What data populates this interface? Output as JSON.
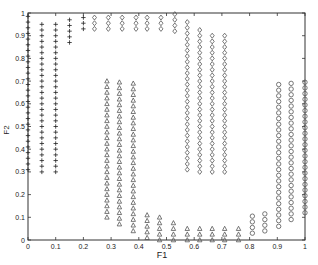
{
  "chart_data": {
    "type": "scatter",
    "title": "",
    "xlabel": "F1",
    "ylabel": "F2",
    "xlim": [
      0,
      1
    ],
    "ylim": [
      0,
      1
    ],
    "grid": false,
    "legend": null,
    "x_ticks": [
      "0",
      "0.1",
      "0.2",
      "0.3",
      "0.4",
      "0.5",
      "0.6",
      "0.7",
      "0.8",
      "0.9",
      "1"
    ],
    "y_ticks": [
      "0",
      "0.1",
      "0.2",
      "0.3",
      "0.4",
      "0.5",
      "0.6",
      "0.7",
      "0.8",
      "0.9",
      "1"
    ],
    "point_step": 0.025,
    "series": [
      {
        "name": "plus",
        "marker": "+",
        "columns": [
          {
            "x": 0.0,
            "y_from": 0.31,
            "y_to": 1.0
          },
          {
            "x": 0.05,
            "y_from": 0.3,
            "y_to": 0.95
          },
          {
            "x": 0.1,
            "y_from": 0.3,
            "y_to": 0.97
          },
          {
            "x": 0.15,
            "y_from": 0.87,
            "y_to": 0.99
          },
          {
            "x": 0.2,
            "y_from": 0.93,
            "y_to": 0.99
          }
        ]
      },
      {
        "name": "diamond",
        "marker": "diamond",
        "columns": [
          {
            "x": 0.24,
            "y_from": 0.93,
            "y_to": 1.0
          },
          {
            "x": 0.29,
            "y_from": 0.93,
            "y_to": 1.0
          },
          {
            "x": 0.34,
            "y_from": 0.93,
            "y_to": 1.0
          },
          {
            "x": 0.39,
            "y_from": 0.93,
            "y_to": 1.0
          },
          {
            "x": 0.43,
            "y_from": 0.93,
            "y_to": 1.0
          },
          {
            "x": 0.48,
            "y_from": 0.93,
            "y_to": 1.0
          },
          {
            "x": 0.53,
            "y_from": 0.92,
            "y_to": 1.0
          },
          {
            "x": 0.575,
            "y_from": 0.31,
            "y_to": 0.97
          },
          {
            "x": 0.62,
            "y_from": 0.3,
            "y_to": 0.94
          },
          {
            "x": 0.665,
            "y_from": 0.3,
            "y_to": 0.92
          },
          {
            "x": 0.71,
            "y_from": 0.3,
            "y_to": 0.9
          }
        ]
      },
      {
        "name": "triangle",
        "marker": "triangle",
        "columns": [
          {
            "x": 0.285,
            "y_from": 0.1,
            "y_to": 0.7
          },
          {
            "x": 0.33,
            "y_from": 0.07,
            "y_to": 0.7
          },
          {
            "x": 0.38,
            "y_from": 0.04,
            "y_to": 0.7
          },
          {
            "x": 0.43,
            "y_from": 0.01,
            "y_to": 0.12
          },
          {
            "x": 0.475,
            "y_from": 0.0,
            "y_to": 0.1
          },
          {
            "x": 0.525,
            "y_from": 0.0,
            "y_to": 0.08
          },
          {
            "x": 0.575,
            "y_from": 0.0,
            "y_to": 0.07
          },
          {
            "x": 0.62,
            "y_from": 0.0,
            "y_to": 0.07
          },
          {
            "x": 0.665,
            "y_from": 0.0,
            "y_to": 0.07
          },
          {
            "x": 0.71,
            "y_from": 0.0,
            "y_to": 0.07
          },
          {
            "x": 0.76,
            "y_from": 0.0,
            "y_to": 0.07
          }
        ]
      },
      {
        "name": "circle",
        "marker": "circle",
        "columns": [
          {
            "x": 0.81,
            "y_from": 0.03,
            "y_to": 0.11
          },
          {
            "x": 0.855,
            "y_from": 0.04,
            "y_to": 0.13
          },
          {
            "x": 0.905,
            "y_from": 0.06,
            "y_to": 0.7
          },
          {
            "x": 0.95,
            "y_from": 0.09,
            "y_to": 0.7
          },
          {
            "x": 1.0,
            "y_from": 0.12,
            "y_to": 0.7
          }
        ]
      }
    ]
  }
}
